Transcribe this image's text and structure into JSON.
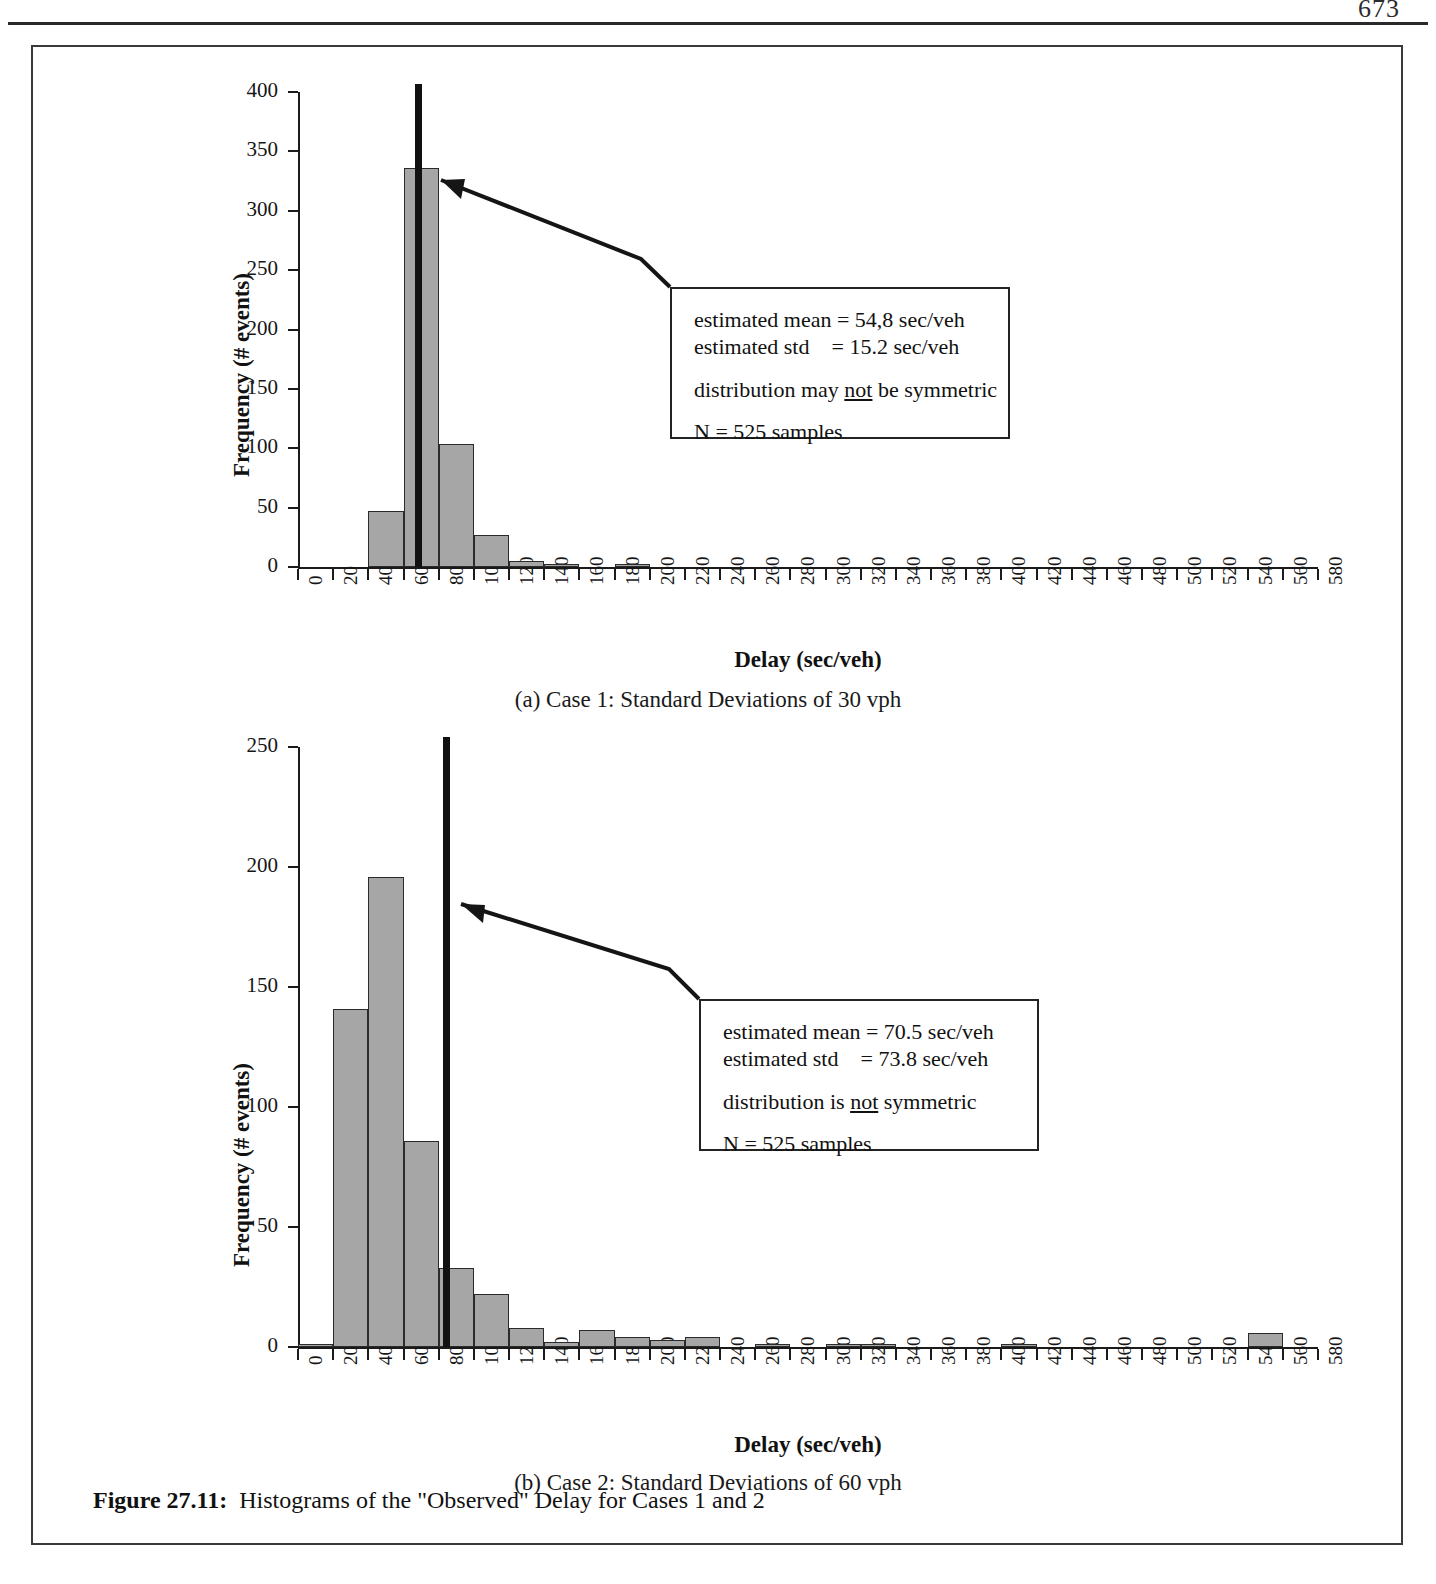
{
  "page": {
    "number": "673",
    "figure_caption_label": "Figure 27.11:",
    "figure_caption_text": "Histograms of the \"Observed\" Delay for Cases 1 and 2"
  },
  "chart_data": [
    {
      "type": "bar",
      "id": "case-1",
      "title": "",
      "subcaption": "(a) Case 1: Standard Deviations of 30 vph",
      "xlabel": "Delay (sec/veh)",
      "ylabel": "Frequency (# events)",
      "xlim": [
        0,
        580
      ],
      "ylim": [
        0,
        400
      ],
      "ytick_labels": [
        "0",
        "50",
        "100",
        "150",
        "200",
        "250",
        "300",
        "350",
        "400"
      ],
      "yticks": [
        0,
        50,
        100,
        150,
        200,
        250,
        300,
        350,
        400
      ],
      "xtick_labels": [
        "0",
        "20",
        "40",
        "60",
        "80",
        "100",
        "120",
        "140",
        "160",
        "180",
        "200",
        "220",
        "240",
        "260",
        "280",
        "300",
        "320",
        "340",
        "360",
        "380",
        "400",
        "420",
        "440",
        "460",
        "480",
        "500",
        "520",
        "540",
        "560",
        "580"
      ],
      "bin_width": 20,
      "bins": [
        0,
        20,
        40,
        60,
        80,
        100,
        120,
        140,
        160,
        180,
        200,
        220,
        240,
        260,
        280,
        300,
        320,
        340,
        360,
        380,
        400,
        420,
        440,
        460,
        480,
        500,
        520,
        540,
        560
      ],
      "values": [
        0,
        0,
        47,
        336,
        104,
        27,
        5,
        2,
        0,
        1,
        0,
        0,
        0,
        0,
        0,
        0,
        0,
        0,
        0,
        0,
        0,
        0,
        0,
        0,
        0,
        0,
        0,
        0,
        0
      ],
      "grid": false,
      "legend": "none",
      "mean_marker": {
        "x": 68,
        "label": "estimated mean line",
        "color": "#111111"
      },
      "annotation": {
        "line1": "estimated mean = 54,8 sec/veh",
        "line2": "estimated std    = 15.2 sec/veh",
        "line3_pre": "distribution may ",
        "line3_underline": "not",
        "line3_post": " be symmetric",
        "line4": "N = 525 samples"
      }
    },
    {
      "type": "bar",
      "id": "case-2",
      "title": "",
      "subcaption": "(b) Case 2: Standard Deviations of 60 vph",
      "xlabel": "Delay (sec/veh)",
      "ylabel": "Frequency (# events)",
      "xlim": [
        0,
        580
      ],
      "ylim": [
        0,
        250
      ],
      "ytick_labels": [
        "0",
        "50",
        "100",
        "150",
        "200",
        "250"
      ],
      "yticks": [
        0,
        50,
        100,
        150,
        200,
        250
      ],
      "xtick_labels": [
        "0",
        "20",
        "40",
        "60",
        "80",
        "100",
        "120",
        "140",
        "160",
        "180",
        "200",
        "220",
        "240",
        "260",
        "280",
        "300",
        "320",
        "340",
        "360",
        "380",
        "400",
        "420",
        "440",
        "460",
        "480",
        "500",
        "520",
        "540",
        "560",
        "580"
      ],
      "bin_width": 20,
      "bins": [
        0,
        20,
        40,
        60,
        80,
        100,
        120,
        140,
        160,
        180,
        200,
        220,
        240,
        260,
        280,
        300,
        320,
        340,
        360,
        380,
        400,
        420,
        440,
        460,
        480,
        500,
        520,
        540,
        560
      ],
      "values": [
        1,
        141,
        196,
        86,
        33,
        22,
        8,
        2,
        7,
        4,
        3,
        4,
        0,
        1,
        0,
        1,
        1,
        0,
        0,
        0,
        1,
        0,
        0,
        0,
        0,
        0,
        0,
        6,
        0
      ],
      "grid": false,
      "legend": "none",
      "mean_marker": {
        "x": 84,
        "label": "estimated mean line",
        "color": "#111111"
      },
      "annotation": {
        "line1": "estimated mean = 70.5 sec/veh",
        "line2": "estimated std    = 73.8 sec/veh",
        "line3_pre": "distribution is ",
        "line3_underline": "not",
        "line3_post": " symmetric",
        "line4": "N = 525 samples"
      }
    }
  ]
}
